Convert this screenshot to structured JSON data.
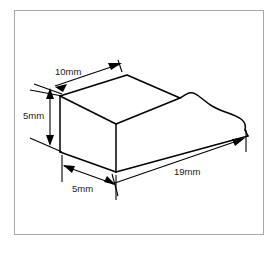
{
  "figure": {
    "background_color": "#ffffff",
    "line_color": "#000000",
    "border_color": "#a8a8a8"
  },
  "dimensions": {
    "top_width": "10mm",
    "height": "5mm",
    "depth": "5mm",
    "length": "19mm"
  },
  "labels": {
    "top_width": "10mm",
    "height": "5mm",
    "depth": "5mm",
    "length": "19mm"
  }
}
